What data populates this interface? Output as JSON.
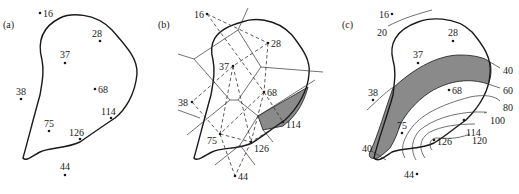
{
  "figure": {
    "panels": [
      {
        "id": "a",
        "label": "(a)",
        "description": "Sample points with region boundary",
        "points": [
          {
            "value": "16",
            "x": 40,
            "y": 13
          },
          {
            "value": "28",
            "x": 100,
            "y": 41
          },
          {
            "value": "37",
            "x": 65,
            "y": 63
          },
          {
            "value": "38",
            "x": 21,
            "y": 99
          },
          {
            "value": "68",
            "x": 95,
            "y": 89
          },
          {
            "value": "114",
            "x": 111,
            "y": 118
          },
          {
            "value": "75",
            "x": 49,
            "y": 131
          },
          {
            "value": "126",
            "x": 80,
            "y": 139
          },
          {
            "value": "44",
            "x": 65,
            "y": 175
          }
        ]
      },
      {
        "id": "b",
        "label": "(b)",
        "description": "Thiessen polygons (solid) and Delaunay triangulation (dashed)",
        "points": [
          {
            "value": "16",
            "x": 207,
            "y": 14
          },
          {
            "value": "28",
            "x": 268,
            "y": 43
          },
          {
            "value": "37",
            "x": 233,
            "y": 66
          },
          {
            "value": "38",
            "x": 192,
            "y": 102
          },
          {
            "value": "68",
            "x": 264,
            "y": 92
          },
          {
            "value": "114",
            "x": 283,
            "y": 122
          },
          {
            "value": "75",
            "x": 220,
            "y": 134
          },
          {
            "value": "126",
            "x": 251,
            "y": 142
          },
          {
            "value": "44",
            "x": 235,
            "y": 176
          }
        ],
        "highlighted_polygon": "114"
      },
      {
        "id": "c",
        "label": "(c)",
        "description": "Isolines interpolated from sample values",
        "points": [
          {
            "value": "16",
            "x": 392,
            "y": 14
          },
          {
            "value": "28",
            "x": 453,
            "y": 41
          },
          {
            "value": "37",
            "x": 418,
            "y": 63
          },
          {
            "value": "38",
            "x": 373,
            "y": 100
          },
          {
            "value": "68",
            "x": 449,
            "y": 90
          },
          {
            "value": "114",
            "x": 464,
            "y": 120
          },
          {
            "value": "75",
            "x": 402,
            "y": 133
          },
          {
            "value": "126",
            "x": 434,
            "y": 140
          },
          {
            "value": "44",
            "x": 417,
            "y": 174
          }
        ],
        "contour_labels": [
          "20",
          "40",
          "60",
          "80",
          "100",
          "120",
          "40"
        ],
        "shaded_band": "40-60"
      }
    ]
  }
}
